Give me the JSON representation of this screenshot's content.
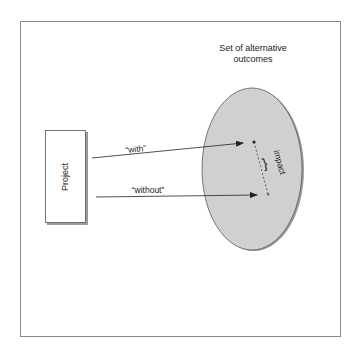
{
  "diagram": {
    "frame": {
      "border_color": "#8a8a8a"
    },
    "outcome_set": {
      "title_line1": "Set of alternative",
      "title_line2": "outcomes",
      "fill_color": "#cfcfcf",
      "border_color": "#555555"
    },
    "project_box": {
      "label": "Project"
    },
    "arrows": [
      {
        "label": "“with”"
      },
      {
        "label": "“without”"
      }
    ],
    "impact": {
      "label": "impact",
      "brace": "}"
    }
  }
}
